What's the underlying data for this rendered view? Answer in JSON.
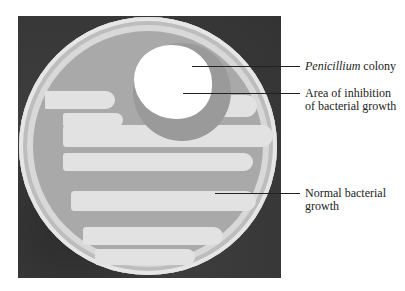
{
  "figure": {
    "type": "labeled photograph",
    "labels": [
      {
        "italic": "Penicillium",
        "text": " colony"
      },
      {
        "line1": "Area of inhibition",
        "line2": "of bacterial growth"
      },
      {
        "line1": "Normal bacterial",
        "line2": "growth"
      }
    ]
  },
  "colors": {
    "background": "#3a3a3a",
    "agar": "#a9a9a9",
    "bacterial_growth": "#e2e2e2",
    "colony": "#ffffff",
    "inhibition_zone": "#9a9a9a"
  }
}
